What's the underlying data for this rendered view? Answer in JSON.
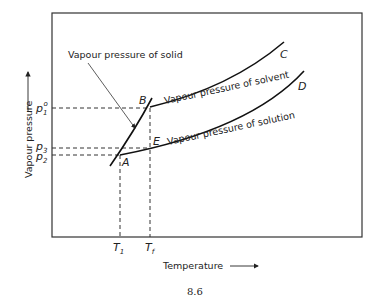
{
  "figure": {
    "caption": "8.6",
    "y_axis_label": "Vapour pressure",
    "x_axis_label": "Temperature",
    "annotation": "Vapour pressure of solid",
    "curves": {
      "solvent": "Vapour pressure of solvent",
      "solution": "Vapour pressure of solution",
      "solvent_end": "C",
      "solution_end": "D"
    },
    "points": {
      "B": "B",
      "E": "E",
      "A": "A"
    },
    "y_ticks": {
      "p1": "p",
      "p1_sub": "1",
      "p1_sup": "o",
      "p3": "p",
      "p3_sub": "3",
      "p2": "p",
      "p2_sub": "2"
    },
    "x_ticks": {
      "t1": "T",
      "t1_sub": "1",
      "tf": "T",
      "tf_sub": "f"
    }
  }
}
